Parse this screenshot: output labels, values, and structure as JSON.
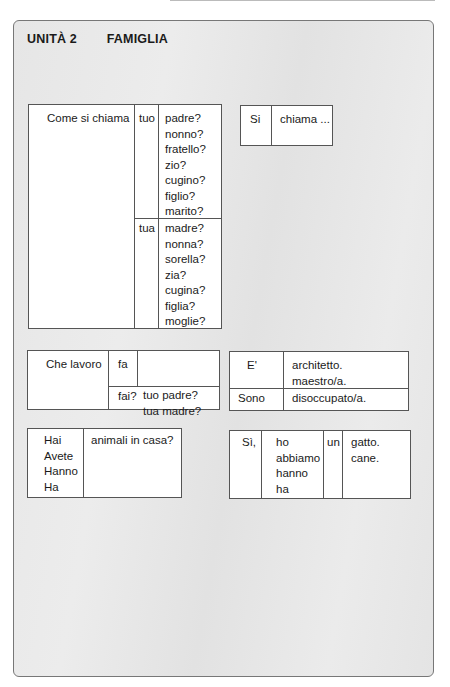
{
  "header": {
    "unit": "UNITÀ 2",
    "topic": "FAMIGLIA"
  },
  "table_name": {
    "question": "Come si chiama",
    "male": {
      "possessive": "tuo",
      "words": [
        "padre?",
        "nonno?",
        "fratello?",
        "zio?",
        "cugino?",
        "figlio?",
        "marito?"
      ]
    },
    "female": {
      "possessive": "tua",
      "words": [
        "madre?",
        "nonna?",
        "sorella?",
        "zia?",
        "cugina?",
        "figlia?",
        "moglie?"
      ]
    }
  },
  "answer_name": {
    "col1": "Si",
    "col2": "chiama ..."
  },
  "table_job": {
    "question": "Che lavoro",
    "verb1": "fa",
    "objects": [
      "tuo  padre?",
      "tua  madre?"
    ],
    "verb2": "fai?"
  },
  "answer_job": {
    "row1": {
      "subject": "E'",
      "words": [
        "architetto.",
        "maestro/a."
      ]
    },
    "row2": {
      "subject": "Sono",
      "words": [
        "disoccupato/a."
      ]
    }
  },
  "table_pets": {
    "subjects": [
      "Hai",
      "Avete",
      "Hanno",
      "Ha"
    ],
    "question": "animali in casa?"
  },
  "answer_pets": {
    "yes": "Sì,",
    "verbs": [
      "ho",
      "abbiamo",
      "hanno",
      "ha"
    ],
    "article": "un",
    "animals": [
      "gatto.",
      "cane."
    ]
  }
}
